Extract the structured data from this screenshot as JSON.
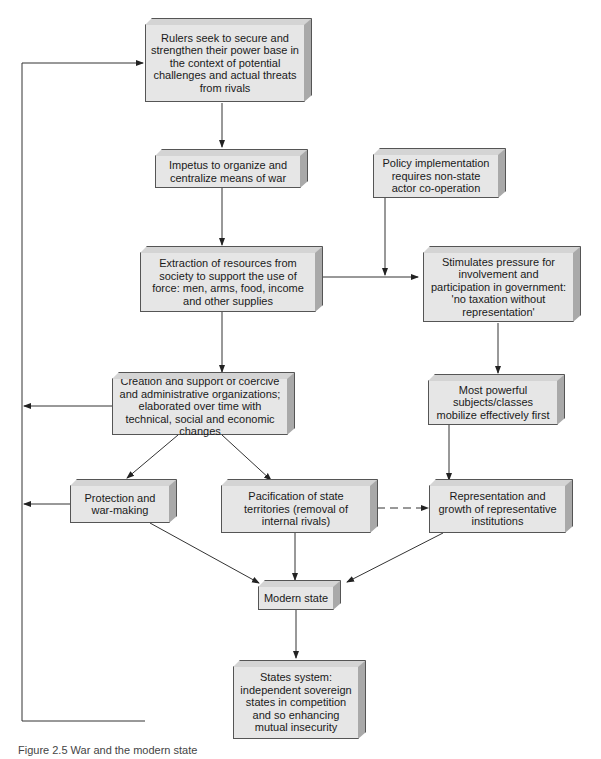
{
  "diagram": {
    "nodes": {
      "rulers": "Rulers seek to secure and strengthen their power base in the context of potential challenges and actual threats from rivals",
      "impetus": "Impetus to organize and centralize means of war",
      "policy": "Policy implementation requires non-state actor co-operation",
      "extraction": "Extraction of resources from society to support the use of force: men, arms, food, income and other supplies",
      "stimulates": "Stimulates pressure for involvement and participation in government: 'no taxation without representation'",
      "creation": "Creation and support of coercive and administrative organizations; elaborated over time with technical, social and economic changes",
      "powerful": "Most powerful subjects/classes mobilize effectively first",
      "protection": "Protection and war-making",
      "pacification": "Pacification of state territories (removal of internal rivals)",
      "representation": "Representation and growth of representative institutions",
      "modern": "Modern state",
      "states_system": "States system: independent sovereign states in competition and so enhancing mutual insecurity"
    },
    "edges": [
      {
        "from": "rulers",
        "to": "impetus"
      },
      {
        "from": "impetus",
        "to": "extraction"
      },
      {
        "from": "extraction",
        "to": "stimulates"
      },
      {
        "from": "policy",
        "to": "extraction-stimulates-link"
      },
      {
        "from": "extraction",
        "to": "creation"
      },
      {
        "from": "stimulates",
        "to": "powerful"
      },
      {
        "from": "creation",
        "to": "protection"
      },
      {
        "from": "creation",
        "to": "pacification"
      },
      {
        "from": "powerful",
        "to": "representation"
      },
      {
        "from": "pacification",
        "to": "representation",
        "style": "dashed"
      },
      {
        "from": "protection",
        "to": "modern"
      },
      {
        "from": "pacification",
        "to": "modern"
      },
      {
        "from": "representation",
        "to": "modern"
      },
      {
        "from": "modern",
        "to": "states_system"
      },
      {
        "from": "states_system",
        "to": "rulers",
        "style": "feedback-loop"
      },
      {
        "from": "creation",
        "to": "feedback-loop"
      },
      {
        "from": "protection",
        "to": "feedback-loop"
      }
    ],
    "caption": "Figure 2.5  War and the modern state"
  }
}
